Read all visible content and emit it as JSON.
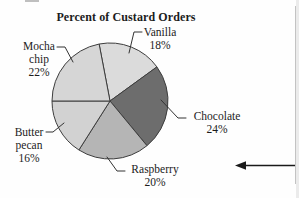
{
  "title": "Percent of Custard Orders",
  "chart_data": {
    "type": "pie",
    "title": "Percent of Custard Orders",
    "unit": "%",
    "start_angle_deg": 100.8,
    "direction": "clockwise",
    "outline_color": "#3d3d3d",
    "slices": [
      {
        "label": "Vanilla",
        "value": 18,
        "color": "#dbdbdb"
      },
      {
        "label": "Chocolate",
        "value": 24,
        "color": "#6d6d6d"
      },
      {
        "label": "Raspberry",
        "value": 20,
        "color": "#b5b5b5"
      },
      {
        "label": "Butter pecan",
        "value": 16,
        "color": "#d2d2d2"
      },
      {
        "label": "Mocha chip",
        "value": 22,
        "color": "#d6d6d6"
      }
    ]
  },
  "labels": {
    "vanilla": {
      "name": "Vanilla",
      "pct": "18%"
    },
    "chocolate": {
      "name": "Chocolate",
      "pct": "24%"
    },
    "raspberry": {
      "name": "Raspberry",
      "pct": "20%"
    },
    "butter_pecan": {
      "name": "Butter\npecan",
      "pct": "16%"
    },
    "mocha_chip": {
      "name": "Mocha\nchip",
      "pct": "22%"
    }
  },
  "annotations": {
    "arrow": "left-pointing-arrow",
    "arrow_color": "#1a1a1a"
  }
}
